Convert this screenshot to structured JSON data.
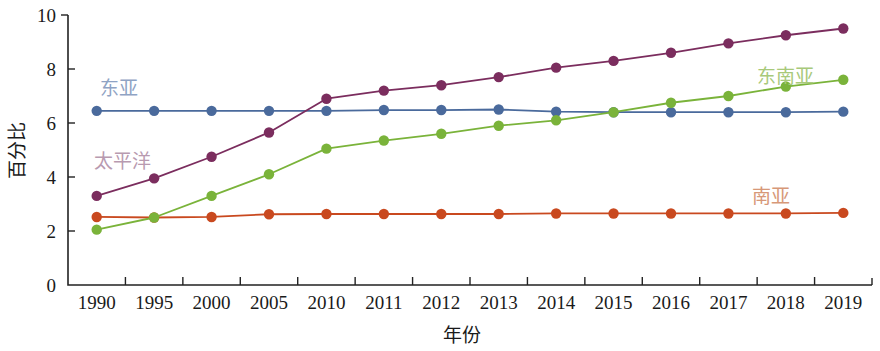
{
  "chart_data": {
    "type": "line",
    "title": "",
    "xlabel": "年份",
    "ylabel": "百分比",
    "ylim": [
      0,
      10
    ],
    "yticks": [
      0,
      2,
      4,
      6,
      8,
      10
    ],
    "grid": false,
    "legend_position": "inline-annotations",
    "categories": [
      "1990",
      "1995",
      "2000",
      "2005",
      "2010",
      "2011",
      "2012",
      "2013",
      "2014",
      "2015",
      "2016",
      "2017",
      "2018",
      "2019"
    ],
    "series": [
      {
        "name": "东亚",
        "color": "#4a6a9c",
        "label_color": "#8fa3c4",
        "label_x": 100,
        "label_y": 95,
        "values": [
          6.45,
          6.45,
          6.45,
          6.45,
          6.45,
          6.48,
          6.48,
          6.5,
          6.42,
          6.4,
          6.4,
          6.4,
          6.4,
          6.42
        ]
      },
      {
        "name": "太平洋",
        "color": "#7b2d5e",
        "label_color": "#b89ab0",
        "label_x": 94,
        "label_y": 168,
        "values": [
          3.3,
          3.95,
          4.75,
          5.65,
          6.9,
          7.2,
          7.4,
          7.7,
          8.05,
          8.3,
          8.6,
          8.95,
          9.25,
          9.5
        ]
      },
      {
        "name": "东南亚",
        "color": "#7ab33a",
        "label_color": "#a8c97a",
        "label_x": 757,
        "label_y": 83,
        "values": [
          2.05,
          2.5,
          3.3,
          4.1,
          5.05,
          5.35,
          5.6,
          5.9,
          6.1,
          6.4,
          6.75,
          7.0,
          7.35,
          7.6
        ]
      },
      {
        "name": "南亚",
        "color": "#c9491f",
        "label_color": "#d79878",
        "label_x": 752,
        "label_y": 203,
        "values": [
          2.52,
          2.5,
          2.52,
          2.62,
          2.63,
          2.63,
          2.63,
          2.63,
          2.65,
          2.65,
          2.65,
          2.65,
          2.65,
          2.67
        ]
      }
    ]
  },
  "plot_geometry": {
    "left": 68,
    "right": 872,
    "top": 15,
    "bottom": 285,
    "tick_len": 7
  }
}
